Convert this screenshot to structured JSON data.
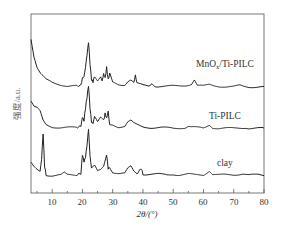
{
  "chart_data": {
    "type": "line",
    "title": "",
    "xlabel": "2θ/(°)",
    "ylabel": "强度/a.u.",
    "xlim": [
      3,
      80
    ],
    "x_ticks": [
      10,
      20,
      30,
      40,
      50,
      60,
      70,
      80
    ],
    "x_minor_ticks": [
      5,
      15,
      25,
      35,
      45,
      55,
      65,
      75
    ],
    "y_ticks": [],
    "grid": false,
    "legend": "inline labels",
    "series": [
      {
        "name": "MnOx/Ti-PILC",
        "label_display": "MnOx/Ti-PILC",
        "offset_rank": 3,
        "x": [
          3,
          4,
          5,
          6,
          8,
          10,
          13,
          15,
          18,
          19.5,
          20,
          20.5,
          21,
          21.5,
          22,
          22.5,
          23,
          23.5,
          24,
          25,
          26,
          26.5,
          27,
          27.5,
          28,
          28.5,
          29,
          30,
          32,
          34,
          35,
          36,
          37,
          37.5,
          38,
          40,
          42,
          43,
          44,
          46,
          48,
          50,
          52,
          54,
          55,
          56,
          57,
          58,
          60,
          62,
          63,
          65,
          68,
          70,
          72,
          73,
          75,
          78,
          80
        ],
        "y": [
          0.95,
          0.7,
          0.55,
          0.47,
          0.38,
          0.34,
          0.31,
          0.29,
          0.29,
          0.3,
          0.4,
          0.42,
          0.55,
          0.72,
          0.9,
          0.6,
          0.38,
          0.35,
          0.43,
          0.37,
          0.42,
          0.36,
          0.46,
          0.4,
          0.55,
          0.38,
          0.46,
          0.34,
          0.31,
          0.31,
          0.36,
          0.38,
          0.34,
          0.44,
          0.33,
          0.3,
          0.29,
          0.33,
          0.29,
          0.29,
          0.29,
          0.29,
          0.29,
          0.3,
          0.31,
          0.32,
          0.38,
          0.3,
          0.29,
          0.31,
          0.3,
          0.29,
          0.28,
          0.28,
          0.3,
          0.29,
          0.28,
          0.28,
          0.28
        ]
      },
      {
        "name": "Ti-PILC",
        "label_display": "Ti-PILC",
        "offset_rank": 2,
        "x": [
          3,
          4,
          5,
          6,
          7,
          8,
          10,
          13,
          15,
          18,
          19.5,
          20,
          20.5,
          21,
          21.5,
          22,
          22.5,
          23,
          23.5,
          24,
          25,
          26,
          27,
          27.5,
          28,
          28.5,
          29,
          30,
          32,
          34,
          35,
          36,
          37,
          38,
          40,
          43,
          46,
          50,
          54,
          55,
          56,
          58,
          60,
          62,
          63,
          65,
          70,
          74,
          75,
          78,
          80
        ],
        "y": [
          0.7,
          0.62,
          0.6,
          0.55,
          0.42,
          0.36,
          0.33,
          0.32,
          0.32,
          0.32,
          0.34,
          0.47,
          0.42,
          0.6,
          0.75,
          0.92,
          0.6,
          0.4,
          0.38,
          0.48,
          0.4,
          0.46,
          0.42,
          0.52,
          0.45,
          0.55,
          0.36,
          0.36,
          0.33,
          0.34,
          0.4,
          0.42,
          0.38,
          0.36,
          0.33,
          0.32,
          0.32,
          0.31,
          0.32,
          0.34,
          0.33,
          0.32,
          0.31,
          0.36,
          0.32,
          0.31,
          0.31,
          0.32,
          0.31,
          0.31,
          0.31
        ]
      },
      {
        "name": "clay",
        "label_display": "clay",
        "offset_rank": 1,
        "x": [
          3,
          4,
          5,
          6,
          6.5,
          7,
          7.5,
          8,
          10,
          13,
          14,
          15,
          18,
          19.5,
          20,
          20.5,
          21,
          21.5,
          22,
          22.5,
          23,
          24,
          25,
          26,
          27,
          28,
          28.5,
          29,
          30,
          32,
          34,
          35,
          36,
          37,
          38,
          39.5,
          40,
          42,
          45,
          48,
          50,
          52,
          55,
          57,
          60,
          62,
          63,
          65,
          68,
          70,
          73,
          75,
          78,
          80
        ],
        "y": [
          0.5,
          0.44,
          0.4,
          0.38,
          0.55,
          0.92,
          0.45,
          0.33,
          0.32,
          0.33,
          0.36,
          0.33,
          0.33,
          0.35,
          0.62,
          0.52,
          0.58,
          0.75,
          0.98,
          0.6,
          0.42,
          0.46,
          0.38,
          0.4,
          0.45,
          0.62,
          0.42,
          0.44,
          0.37,
          0.35,
          0.35,
          0.42,
          0.45,
          0.38,
          0.35,
          0.42,
          0.34,
          0.34,
          0.34,
          0.33,
          0.34,
          0.33,
          0.34,
          0.33,
          0.33,
          0.39,
          0.34,
          0.33,
          0.33,
          0.33,
          0.35,
          0.33,
          0.33,
          0.32
        ]
      }
    ],
    "annotations": [
      "MnOx/Ti-PILC",
      "Ti-PILC",
      "clay"
    ]
  },
  "labels": {
    "xlabel": "2θ/(°)",
    "ylabel": "强度/a.u.",
    "series_mnox_prefix": "MnO",
    "series_mnox_sub": "x",
    "series_mnox_suffix": "/Ti-PILC",
    "series_tipilc": "Ti-PILC",
    "series_clay": "clay",
    "ticks": [
      "10",
      "20",
      "30",
      "40",
      "50",
      "60",
      "70",
      "80"
    ]
  }
}
